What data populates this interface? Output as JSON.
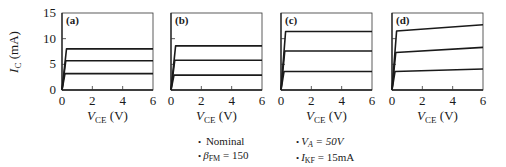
{
  "chart_data": [
    {
      "type": "line",
      "panel": "(a)",
      "title": "Nominal",
      "xlabel": "V_CE (V)",
      "ylabel": "I_C (mA)",
      "xlim": [
        0,
        6
      ],
      "ylim": [
        0,
        15
      ],
      "xticks": [
        0,
        2,
        4,
        6
      ],
      "yticks": [
        0,
        5,
        10,
        15
      ],
      "series": [
        {
          "name": "curve-1",
          "x": [
            0,
            0.3,
            6
          ],
          "y": [
            0,
            8.0,
            8.0
          ]
        },
        {
          "name": "curve-2",
          "x": [
            0,
            0.25,
            6
          ],
          "y": [
            0,
            5.7,
            5.7
          ]
        },
        {
          "name": "curve-3",
          "x": [
            0,
            0.2,
            6
          ],
          "y": [
            0,
            3.2,
            3.2
          ]
        }
      ]
    },
    {
      "type": "line",
      "panel": "(b)",
      "title": "beta_FM = 150",
      "xlabel": "V_CE (V)",
      "xlim": [
        0,
        6
      ],
      "ylim": [
        0,
        15
      ],
      "xticks": [
        0,
        2,
        4,
        6
      ],
      "yticks": [
        0,
        5,
        10,
        15
      ],
      "series": [
        {
          "name": "curve-1",
          "x": [
            0,
            0.3,
            6
          ],
          "y": [
            0,
            8.6,
            8.6
          ]
        },
        {
          "name": "curve-2",
          "x": [
            0,
            0.25,
            6
          ],
          "y": [
            0,
            5.8,
            5.8
          ]
        },
        {
          "name": "curve-3",
          "x": [
            0,
            0.2,
            6
          ],
          "y": [
            0,
            2.9,
            2.9
          ]
        }
      ]
    },
    {
      "type": "line",
      "panel": "(c)",
      "title": "I_KF = 15mA",
      "xlabel": "V_CE (V)",
      "xlim": [
        0,
        6
      ],
      "ylim": [
        0,
        15
      ],
      "xticks": [
        0,
        2,
        4,
        6
      ],
      "yticks": [
        0,
        5,
        10,
        15
      ],
      "series": [
        {
          "name": "curve-1",
          "x": [
            0,
            0.3,
            6
          ],
          "y": [
            0,
            11.4,
            11.4
          ]
        },
        {
          "name": "curve-2",
          "x": [
            0,
            0.25,
            6
          ],
          "y": [
            0,
            7.6,
            7.6
          ]
        },
        {
          "name": "curve-3",
          "x": [
            0,
            0.2,
            6
          ],
          "y": [
            0,
            3.6,
            3.6
          ]
        }
      ]
    },
    {
      "type": "line",
      "panel": "(d)",
      "title": "V_A = 50V",
      "xlabel": "V_CE (V)",
      "xlim": [
        0,
        6
      ],
      "ylim": [
        0,
        15
      ],
      "xticks": [
        0,
        2,
        4,
        6
      ],
      "yticks": [
        0,
        5,
        10,
        15
      ],
      "series": [
        {
          "name": "curve-1",
          "x": [
            0,
            0.3,
            6
          ],
          "y": [
            0,
            11.5,
            12.7
          ]
        },
        {
          "name": "curve-2",
          "x": [
            0,
            0.25,
            6
          ],
          "y": [
            0,
            7.3,
            8.3
          ]
        },
        {
          "name": "curve-3",
          "x": [
            0,
            0.2,
            6
          ],
          "y": [
            0,
            3.6,
            4.1
          ]
        }
      ]
    }
  ],
  "labels": {
    "panels": [
      "(a)",
      "(b)",
      "(c)",
      "(d)"
    ],
    "ylabel_main": "I",
    "ylabel_sub": "C",
    "ylabel_unit": " (mA)",
    "xlabel_main": "V",
    "xlabel_sub": "CE",
    "xlabel_unit": " (V)",
    "xtick_labels": [
      "0",
      "2",
      "4",
      "6"
    ],
    "ytick_labels": [
      "0",
      "5",
      "10",
      "15"
    ]
  },
  "legend": {
    "bullet": "•",
    "items": [
      {
        "id": "nominal",
        "text": "Nominal"
      },
      {
        "id": "beta",
        "main": "β",
        "sub": "FM",
        "rest": " = 150"
      },
      {
        "id": "va",
        "main": "V",
        "sub": "A",
        "rest": " = 50V"
      },
      {
        "id": "ikf",
        "main": "I",
        "sub": "KF",
        "rest": " = 15mA"
      }
    ]
  },
  "colors": {
    "curve": "#1a1a1a",
    "frame": "#333333"
  }
}
